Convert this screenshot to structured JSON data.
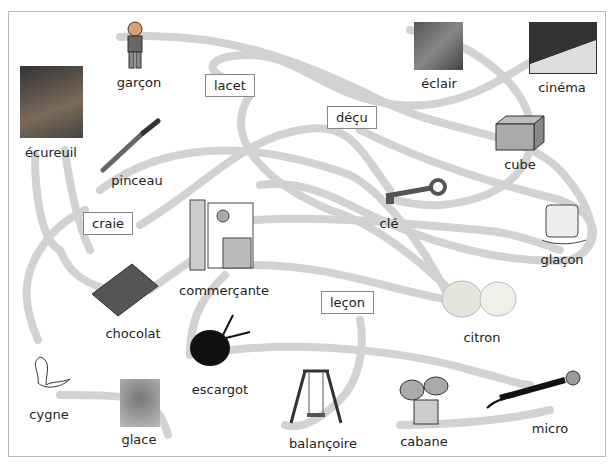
{
  "colors": {
    "path": "#d2d2d2",
    "border": "#b8b8b8",
    "text": "#222222"
  },
  "boxed_words": [
    {
      "id": "lacet",
      "label": "lacet"
    },
    {
      "id": "decu",
      "label": "déçu"
    },
    {
      "id": "craie",
      "label": "craie"
    },
    {
      "id": "lecon",
      "label": "leçon"
    }
  ],
  "pictures": [
    {
      "id": "garcon",
      "label": "garçon"
    },
    {
      "id": "ecureuil",
      "label": "écureuil"
    },
    {
      "id": "pinceau",
      "label": "pinceau"
    },
    {
      "id": "eclair",
      "label": "éclair"
    },
    {
      "id": "cinema",
      "label": "cinéma"
    },
    {
      "id": "cube",
      "label": "cube"
    },
    {
      "id": "cle",
      "label": "clé"
    },
    {
      "id": "glacon",
      "label": "glaçon"
    },
    {
      "id": "commercante",
      "label": "commerçante"
    },
    {
      "id": "chocolat",
      "label": "chocolat"
    },
    {
      "id": "citron",
      "label": "citron"
    },
    {
      "id": "escargot",
      "label": "escargot"
    },
    {
      "id": "cygne",
      "label": "cygne"
    },
    {
      "id": "glace",
      "label": "glace"
    },
    {
      "id": "balancoire",
      "label": "balançoire"
    },
    {
      "id": "cabane",
      "label": "cabane"
    },
    {
      "id": "micro",
      "label": "micro"
    }
  ]
}
